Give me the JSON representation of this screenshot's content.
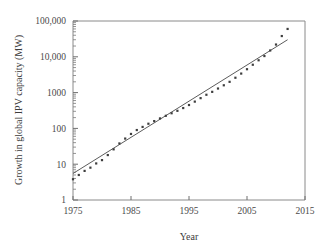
{
  "chart_data": {
    "type": "scatter",
    "title": "",
    "xlabel": "Year",
    "ylabel": "Growth in global IPV capacity (MW)",
    "xlim": [
      1975,
      2015
    ],
    "ylim": [
      1,
      100000
    ],
    "yscale": "log",
    "xscale": "linear",
    "grid": false,
    "legend": null,
    "xticks": [
      1975,
      1985,
      1995,
      2005,
      2015
    ],
    "xtick_labels": [
      "1975",
      "1985",
      "1995",
      "2005",
      "2015"
    ],
    "yticks": [
      1,
      10,
      100,
      1000,
      10000,
      100000
    ],
    "ytick_labels": [
      "1",
      "10",
      "100",
      "1000",
      "10,000",
      "100,000"
    ],
    "minor_ticks": "log-decade-subdivisions",
    "series": [
      {
        "name": "Global IPV capacity",
        "marker": "square",
        "color": "#3d3d3d",
        "x": [
          1975,
          1976,
          1977,
          1978,
          1979,
          1980,
          1981,
          1982,
          1983,
          1984,
          1985,
          1986,
          1987,
          1988,
          1989,
          1990,
          1991,
          1992,
          1993,
          1994,
          1995,
          1996,
          1997,
          1998,
          1999,
          2000,
          2001,
          2002,
          2003,
          2004,
          2005,
          2006,
          2007,
          2008,
          2009,
          2010,
          2011,
          2012
        ],
        "values": [
          3.8,
          5.0,
          6.5,
          8.0,
          10.5,
          13.0,
          18.0,
          26.0,
          38.0,
          52.0,
          70.0,
          90.0,
          110.0,
          135.0,
          160.0,
          190.0,
          225.0,
          265.0,
          310.0,
          370.0,
          450.0,
          560.0,
          700.0,
          870.0,
          1050.0,
          1300.0,
          1600.0,
          2000.0,
          2600.0,
          3400.0,
          4500.0,
          6000.0,
          8000.0,
          10500.0,
          15000.0,
          22000.0,
          38000.0,
          60000.0
        ]
      }
    ],
    "fit_line": {
      "name": "Exponential trend fit",
      "color": "#5c5c5c",
      "x_start": 1975,
      "y_start": 5.5,
      "x_end": 2012,
      "y_end": 30000
    }
  },
  "axes": {
    "x_title": "Year",
    "y_title": "Growth in global IPV capacity (MW)"
  }
}
